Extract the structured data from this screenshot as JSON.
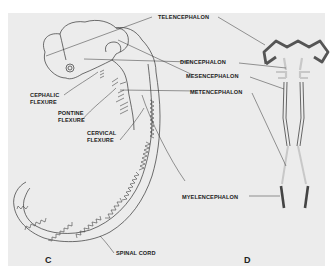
{
  "figure": {
    "panels": [
      {
        "id": "C",
        "label": "C",
        "description": "Lateral view of embryonic brain and spinal cord showing flexures"
      },
      {
        "id": "D",
        "label": "D",
        "description": "Schematic longitudinal section of neural tube divisions"
      }
    ],
    "labels": {
      "telencephalon": "TELENCEPHALON",
      "diencephalon": "DIENCEPHALON",
      "mesencephalon": "MESENCEPHALON",
      "metencephalon": "METENCEPHALON",
      "myelencephalon": "MYELENCEPHALON",
      "cephalic_flexure": "CEPHALIC\nFLEXURE",
      "pontine_flexure": "PONTINE\nFLEXURE",
      "cervical_flexure": "CERVICAL\nFLEXURE",
      "spinal_cord": "SPINAL CORD"
    },
    "colors": {
      "background": "#ececec",
      "line": "#333333",
      "telencephalon_shape": "#555555",
      "diencephalon_shape": "#c8c8c8",
      "myelencephalon_shape": "#444444"
    }
  }
}
